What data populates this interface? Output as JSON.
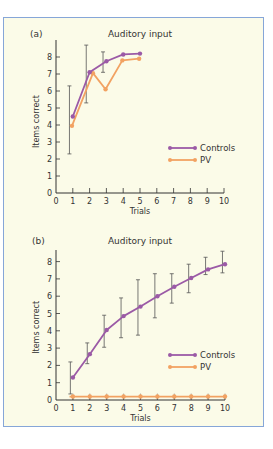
{
  "colors": {
    "controls": "#9b5aa6",
    "pv": "#f2a262",
    "frame_border": "#86a6d8",
    "frame_bg": "#fbfbe8",
    "axis": "#333333",
    "ylabel_b": "#c0503a"
  },
  "chart_data": [
    {
      "type": "line",
      "panel_label": "(a)",
      "title": "Auditory input",
      "xlabel": "Trials",
      "ylabel": "Items correct",
      "xlim": [
        0,
        10
      ],
      "ylim": [
        0,
        8.8
      ],
      "xticks": [
        "0",
        "1",
        "2",
        "3",
        "4",
        "5",
        "6",
        "7",
        "8",
        "9",
        "10"
      ],
      "yticks": [
        "0",
        "1",
        "2",
        "3",
        "4",
        "5",
        "6",
        "7",
        "8"
      ],
      "grid": false,
      "legend_position": "right-middle",
      "series": [
        {
          "name": "Controls",
          "x": [
            1,
            2,
            3,
            4,
            5
          ],
          "values": [
            4.5,
            7.1,
            7.75,
            8.15,
            8.2
          ]
        },
        {
          "name": "PV",
          "x": [
            0.95,
            2.2,
            2.95,
            3.95,
            4.95
          ],
          "values": [
            3.95,
            7.05,
            6.1,
            7.8,
            7.9
          ]
        }
      ],
      "error_bars": [
        {
          "x": 0.8,
          "low": 2.3,
          "high": 6.3
        },
        {
          "x": 1.8,
          "low": 5.3,
          "high": 8.7
        },
        {
          "x": 2.8,
          "low": 7.1,
          "high": 8.3
        }
      ]
    },
    {
      "type": "line",
      "panel_label": "(b)",
      "title": "Auditory input",
      "xlabel": "Trials",
      "ylabel": "Items correct",
      "xlim": [
        0,
        10
      ],
      "ylim": [
        0,
        8.8
      ],
      "xticks": [
        "0",
        "1",
        "2",
        "3",
        "4",
        "5",
        "6",
        "7",
        "8",
        "9",
        "10"
      ],
      "yticks": [
        "0",
        "1",
        "2",
        "3",
        "4",
        "5",
        "6",
        "7",
        "8"
      ],
      "grid": false,
      "legend_position": "right-middle",
      "series": [
        {
          "name": "Controls",
          "x": [
            1,
            2,
            3,
            4,
            5,
            6,
            7,
            8,
            9,
            10
          ],
          "values": [
            1.3,
            2.65,
            4.05,
            4.85,
            5.4,
            6.0,
            6.55,
            7.05,
            7.55,
            7.85
          ]
        },
        {
          "name": "PV",
          "x": [
            1,
            2,
            3,
            4,
            5,
            6,
            7,
            8,
            9,
            10
          ],
          "values": [
            0.2,
            0.2,
            0.2,
            0.2,
            0.2,
            0.2,
            0.2,
            0.2,
            0.2,
            0.2
          ]
        }
      ],
      "error_bars": [
        {
          "x": 0.85,
          "low": 0.35,
          "high": 2.2
        },
        {
          "x": 1.85,
          "low": 2.1,
          "high": 3.3
        },
        {
          "x": 2.85,
          "low": 3.05,
          "high": 4.9
        },
        {
          "x": 3.85,
          "low": 3.6,
          "high": 5.9
        },
        {
          "x": 4.85,
          "low": 3.75,
          "high": 6.95
        },
        {
          "x": 5.85,
          "low": 4.75,
          "high": 7.3
        },
        {
          "x": 6.85,
          "low": 5.6,
          "high": 7.3
        },
        {
          "x": 7.85,
          "low": 6.2,
          "high": 7.85
        },
        {
          "x": 8.85,
          "low": 7.25,
          "high": 8.25
        },
        {
          "x": 9.85,
          "low": 7.35,
          "high": 8.6
        }
      ],
      "pv_error_bars_small": true
    }
  ]
}
